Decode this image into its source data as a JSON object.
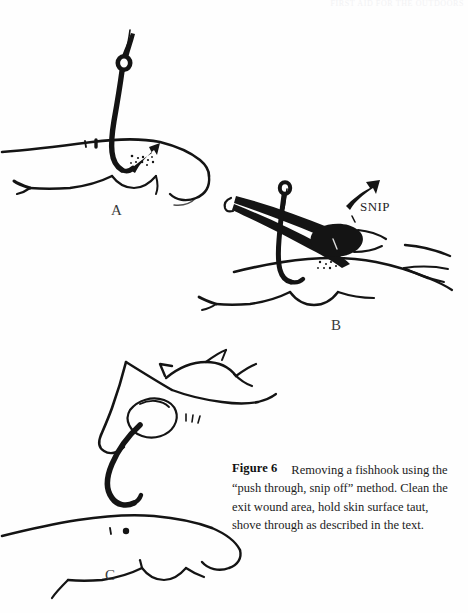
{
  "page": {
    "background_color": "#fefefe",
    "ink_color": "#141414",
    "running_header_text": "FIRST AID FOR THE OUTDOORS"
  },
  "figure": {
    "number_label": "Figure 6",
    "caption_text": "Removing a fishhook using the “push through, snip off” method. Clean the exit wound area, hold skin surface taut, shove through as described in the text.",
    "annotations": [
      {
        "name": "snip",
        "text": "SNIP"
      }
    ],
    "panels": [
      {
        "id": "A",
        "label": "A",
        "description": "Fishhook embedded in a finger; the barbed point has been pushed through the skin and protrudes from the exit wound."
      },
      {
        "id": "B",
        "label": "B",
        "description": "Wire cutters grip the protruding barbed point of the hook, about to snip it off at the marked SNIP location."
      },
      {
        "id": "C",
        "label": "C",
        "description": "With the barb removed, fingers grasp the eye of the hook and back the remaining shank out of the entry wound."
      }
    ]
  }
}
